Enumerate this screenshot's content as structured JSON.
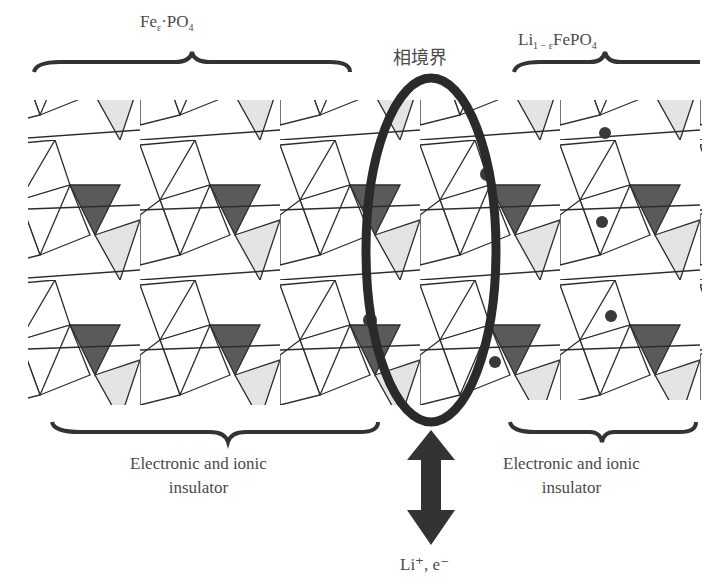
{
  "title_left": {
    "main": "Fe",
    "sub": "ε",
    "rest": "·PO",
    "sub2": "4"
  },
  "title_right": {
    "main": "Li",
    "sub": "1 − ε",
    "rest": "FePO",
    "sub2": "4"
  },
  "boundary_label": "相境界",
  "insulator_left": {
    "line1": "Electronic and ionic",
    "line2": "insulator"
  },
  "insulator_right": {
    "line1": "Electronic and ionic",
    "line2": "insulator"
  },
  "arrow_label": "Li⁺, e⁻",
  "colors": {
    "line": "#2b2b2b",
    "dark_fill": "#5a5a5a",
    "light_fill": "#e4e4e4",
    "ellipse": "#2a2a2a",
    "ion": "#3a3a3a"
  }
}
